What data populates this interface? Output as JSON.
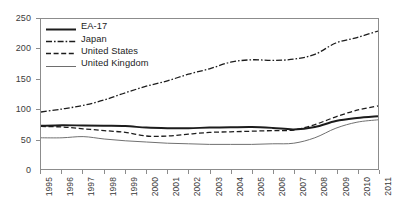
{
  "chart_data": {
    "type": "line",
    "title": "",
    "subtitle": "",
    "xlabel": "",
    "ylabel": "",
    "x": [
      1995,
      1996,
      1997,
      1998,
      1999,
      2000,
      2001,
      2002,
      2003,
      2004,
      2005,
      2006,
      2007,
      2008,
      2009,
      2010,
      2011
    ],
    "xlim": [
      1995,
      2011
    ],
    "ylim": [
      0,
      250
    ],
    "y_ticks": [
      0,
      50,
      100,
      150,
      200,
      250
    ],
    "x_tick_labels": [
      "1995",
      "1996",
      "1997",
      "1998",
      "1999",
      "2000",
      "2001",
      "2002",
      "2003",
      "2004",
      "2005",
      "2006",
      "2007",
      "2008",
      "2009",
      "2010",
      "2011"
    ],
    "grid": false,
    "legend_position": "top-left",
    "series": [
      {
        "name": "EA-17",
        "style": "solid-thick",
        "color": "#1c1c1c",
        "values": [
          72,
          73,
          72.5,
          72,
          71.5,
          69,
          68,
          68,
          69,
          69.5,
          70,
          68.5,
          66,
          70,
          80,
          85,
          88
        ]
      },
      {
        "name": "Japan",
        "style": "dash-dot",
        "color": "#1c1c1c",
        "values": [
          95,
          100,
          106,
          115,
          127,
          138,
          147,
          158,
          167,
          178,
          182,
          181,
          183,
          191,
          210,
          219,
          230
        ]
      },
      {
        "name": "United States",
        "style": "dashed",
        "color": "#1c1c1c",
        "values": [
          71,
          70,
          67,
          64,
          61,
          55,
          55,
          58,
          61,
          62,
          63,
          64,
          65,
          74,
          87,
          98,
          105
        ]
      },
      {
        "name": "United Kingdom",
        "style": "solid-thin",
        "color": "#6e6e6e",
        "values": [
          52,
          52,
          54,
          50,
          47,
          45,
          43,
          42,
          41,
          41,
          41,
          42,
          43,
          52,
          68,
          78,
          82
        ]
      }
    ]
  },
  "legend": {
    "items": [
      {
        "label": "EA-17",
        "style": "solid-thick"
      },
      {
        "label": "Japan",
        "style": "dash-dot"
      },
      {
        "label": "United States",
        "style": "dashed"
      },
      {
        "label": "United Kingdom",
        "style": "solid-thin"
      }
    ]
  },
  "colors": {
    "axis": "#8c8c8c",
    "text": "#3b3b3b",
    "series_dark": "#1c1c1c",
    "series_grey": "#6e6e6e",
    "background": "#ffffff"
  }
}
